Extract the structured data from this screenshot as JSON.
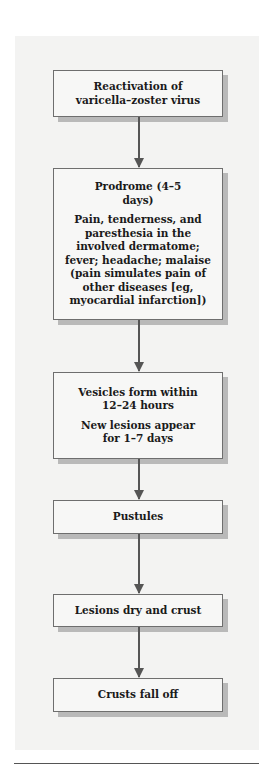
{
  "flowchart": {
    "direction": "top-to-bottom",
    "steps": [
      {
        "id": "reactivation",
        "lines": [
          "Reactivation of varicella–zoster virus"
        ]
      },
      {
        "id": "prodrome",
        "lines": [
          "Prodrome (4–5 days)",
          "Pain, tenderness, and paresthesia in the involved dermatome; fever; headache; malaise (pain simulates pain of other diseases [eg, myocardial infarction])"
        ]
      },
      {
        "id": "vesicles",
        "lines": [
          "Vesicles form within 12–24 hours",
          "New lesions appear for 1–7 days"
        ]
      },
      {
        "id": "pustules",
        "lines": [
          "Pustules"
        ]
      },
      {
        "id": "dry-crust",
        "lines": [
          "Lesions dry and crust"
        ]
      },
      {
        "id": "crusts-fall",
        "lines": [
          "Crusts fall off"
        ]
      }
    ],
    "colors": {
      "panel_background": "#f3f3f2",
      "box_background": "#f7f7f6",
      "box_border": "#6e6e6e",
      "box_shadow": "#b9b9b9",
      "arrow": "#555555",
      "text": "#1a1a1a"
    }
  }
}
